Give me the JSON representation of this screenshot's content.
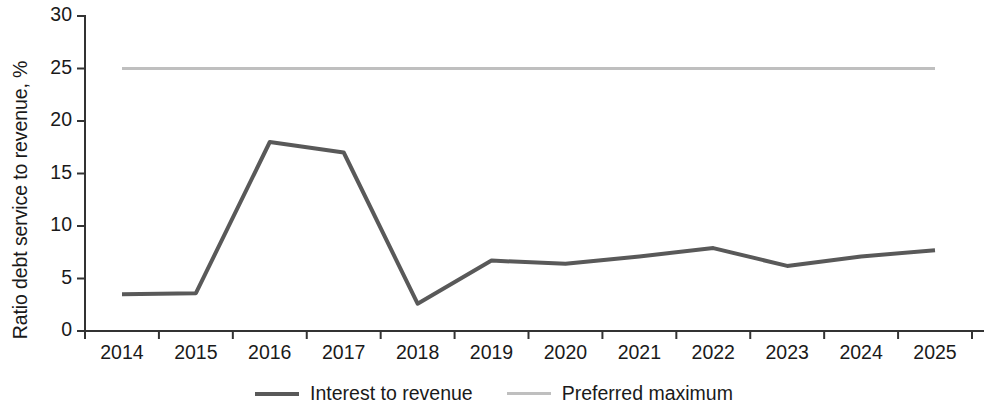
{
  "chart_data": {
    "type": "line",
    "title": "",
    "xlabel": "",
    "ylabel": "Ratio debt service to revenue, %",
    "categories": [
      "2014",
      "2015",
      "2016",
      "2017",
      "2018",
      "2019",
      "2020",
      "2021",
      "2022",
      "2023",
      "2024",
      "2025"
    ],
    "ylim": [
      0,
      30
    ],
    "yticks": [
      0,
      5,
      10,
      15,
      20,
      25,
      30
    ],
    "ytick_labels": [
      "0",
      "5",
      "10",
      "15",
      "20",
      "25",
      "30"
    ],
    "grid": false,
    "legend_position": "bottom-center",
    "series": [
      {
        "name": "Interest to revenue",
        "color": "#595959",
        "linewidth": 4,
        "values": [
          3.5,
          3.6,
          18.0,
          17.0,
          2.6,
          6.7,
          6.4,
          7.1,
          7.9,
          6.2,
          7.1,
          7.7
        ]
      },
      {
        "name": "Preferred maximum",
        "color": "#bfbfbf",
        "linewidth": 3,
        "values": [
          25.0,
          25.0,
          25.0,
          25.0,
          25.0,
          25.0,
          25.0,
          25.0,
          25.0,
          25.0,
          25.0,
          25.0
        ]
      }
    ]
  },
  "axis": {
    "y_label": "Ratio debt service to revenue, %",
    "y_tick_labels": [
      "30",
      "25",
      "20",
      "15",
      "10",
      "5",
      "0"
    ],
    "x_tick_labels": [
      "2014",
      "2015",
      "2016",
      "2017",
      "2018",
      "2019",
      "2020",
      "2021",
      "2022",
      "2023",
      "2024",
      "2025"
    ],
    "axis_color": "#333333"
  },
  "legend": {
    "items": [
      {
        "label": "Interest to revenue",
        "color": "#595959"
      },
      {
        "label": "Preferred maximum",
        "color": "#bfbfbf"
      }
    ]
  }
}
